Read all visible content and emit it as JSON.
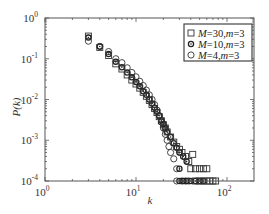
{
  "chart_data": {
    "type": "scatter",
    "title": "",
    "xlabel": "k",
    "ylabel": "P(k)",
    "xscale": "log",
    "yscale": "log",
    "xlim": [
      1,
      200
    ],
    "ylim": [
      0.0001,
      1
    ],
    "x_ticks": [
      {
        "value": 1,
        "label_base": "10",
        "label_exp": "0"
      },
      {
        "value": 10,
        "label_base": "10",
        "label_exp": "1"
      },
      {
        "value": 100,
        "label_base": "10",
        "label_exp": "2"
      }
    ],
    "y_ticks": [
      {
        "value": 1,
        "label_base": "10",
        "label_exp": "0"
      },
      {
        "value": 0.1,
        "label_base": "10",
        "label_exp": "-1"
      },
      {
        "value": 0.01,
        "label_base": "10",
        "label_exp": "-2"
      },
      {
        "value": 0.001,
        "label_base": "10",
        "label_exp": "-3"
      },
      {
        "value": 0.0001,
        "label_base": "10",
        "label_exp": "-4"
      }
    ],
    "grid": false,
    "legend_position": "upper right",
    "series": [
      {
        "name": "M=30,m=3",
        "label_parts": [
          "M",
          "=30,",
          "m",
          "=3"
        ],
        "marker": "square",
        "points": [
          [
            3,
            0.36
          ],
          [
            4,
            0.19
          ],
          [
            5,
            0.12
          ],
          [
            6,
            0.075
          ],
          [
            7,
            0.056
          ],
          [
            8,
            0.04
          ],
          [
            9,
            0.03
          ],
          [
            10,
            0.024
          ],
          [
            11,
            0.019
          ],
          [
            12,
            0.015
          ],
          [
            13,
            0.012
          ],
          [
            14,
            0.0095
          ],
          [
            15,
            0.0075
          ],
          [
            16,
            0.006
          ],
          [
            17,
            0.0048
          ],
          [
            18,
            0.0038
          ],
          [
            19,
            0.003
          ],
          [
            20,
            0.0024
          ],
          [
            21,
            0.002
          ],
          [
            22,
            0.0016
          ],
          [
            24,
            0.0012
          ],
          [
            26,
            0.0009
          ],
          [
            28,
            0.0007
          ],
          [
            30,
            0.0006
          ],
          [
            32,
            0.0005
          ],
          [
            35,
            0.0004
          ],
          [
            38,
            0.0003
          ],
          [
            42,
            0.00045
          ],
          [
            40,
            0.0002
          ],
          [
            45,
            0.0002
          ],
          [
            50,
            0.0002
          ],
          [
            55,
            0.0002
          ],
          [
            60,
            0.0002
          ],
          [
            45,
            0.0001
          ],
          [
            50,
            0.0001
          ],
          [
            55,
            0.0001
          ],
          [
            60,
            0.0001
          ],
          [
            65,
            0.0001
          ],
          [
            70,
            0.0001
          ],
          [
            75,
            0.0001
          ]
        ]
      },
      {
        "name": "M=10,m=3",
        "label_parts": [
          "M",
          "=10,",
          "m",
          "=3"
        ],
        "marker": "circle-dot",
        "points": [
          [
            3,
            0.33
          ],
          [
            4,
            0.2
          ],
          [
            5,
            0.13
          ],
          [
            6,
            0.085
          ],
          [
            7,
            0.062
          ],
          [
            8,
            0.046
          ],
          [
            9,
            0.035
          ],
          [
            10,
            0.027
          ],
          [
            11,
            0.021
          ],
          [
            12,
            0.016
          ],
          [
            13,
            0.013
          ],
          [
            14,
            0.01
          ],
          [
            15,
            0.008
          ],
          [
            16,
            0.0063
          ],
          [
            17,
            0.005
          ],
          [
            18,
            0.004
          ],
          [
            19,
            0.0031
          ],
          [
            20,
            0.0025
          ],
          [
            21,
            0.002
          ],
          [
            22,
            0.0016
          ],
          [
            24,
            0.0012
          ],
          [
            26,
            0.00085
          ],
          [
            28,
            0.00065
          ],
          [
            30,
            0.0005
          ],
          [
            33,
            0.0004
          ],
          [
            36,
            0.0003
          ],
          [
            30,
            0.0002
          ],
          [
            30,
            0.0001
          ],
          [
            33,
            0.0001
          ],
          [
            36,
            0.0001
          ],
          [
            40,
            0.0001
          ],
          [
            45,
            0.0001
          ],
          [
            50,
            0.0001
          ],
          [
            55,
            0.0001
          ]
        ]
      },
      {
        "name": "M=4,m=3",
        "label_parts": [
          "M",
          "=4,",
          "m",
          "=3"
        ],
        "marker": "circle",
        "points": [
          [
            3,
            0.27
          ],
          [
            4,
            0.2
          ],
          [
            5,
            0.15
          ],
          [
            6,
            0.1
          ],
          [
            7,
            0.08
          ],
          [
            8,
            0.06
          ],
          [
            9,
            0.046
          ],
          [
            10,
            0.036
          ],
          [
            11,
            0.028
          ],
          [
            12,
            0.022
          ],
          [
            13,
            0.017
          ],
          [
            14,
            0.013
          ],
          [
            15,
            0.01
          ],
          [
            16,
            0.0075
          ],
          [
            17,
            0.0055
          ],
          [
            18,
            0.004
          ],
          [
            19,
            0.0028
          ],
          [
            20,
            0.002
          ],
          [
            21,
            0.0014
          ],
          [
            22,
            0.001
          ],
          [
            23,
            0.0007
          ],
          [
            24,
            0.0005
          ],
          [
            26,
            0.00035
          ],
          [
            28,
            0.0002
          ],
          [
            28,
            0.0001
          ],
          [
            32,
            0.0001
          ],
          [
            35,
            0.0001
          ],
          [
            38,
            0.0001
          ]
        ]
      }
    ]
  }
}
